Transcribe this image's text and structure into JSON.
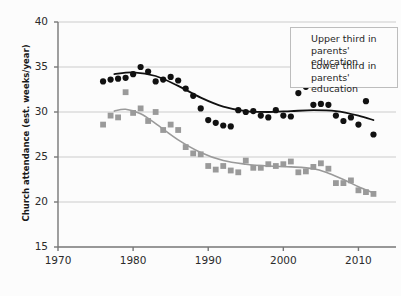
{
  "clipped_header": "...... .....",
  "chart_data": {
    "type": "scatter",
    "title": "",
    "xlabel": "",
    "ylabel": "Church attendance (est. weeks/year)",
    "xlim": [
      1970,
      2015
    ],
    "ylim": [
      15,
      40
    ],
    "xticks": [
      1970,
      1980,
      1990,
      2000,
      2010
    ],
    "yticks": [
      40,
      35,
      30,
      25,
      20,
      15
    ],
    "grid": "horizontal",
    "legend_position": "top-right",
    "colors": {
      "upper_third": "#111111",
      "lower_third": "#9a9a9a",
      "grid": "#cccccc",
      "axis": "#777777",
      "background": "#fcfcfc"
    },
    "series": [
      {
        "name": "Upper third in parents' education",
        "marker": "circle",
        "color": "#111111",
        "points": [
          [
            1976,
            33.4
          ],
          [
            1977,
            33.6
          ],
          [
            1978,
            33.7
          ],
          [
            1979,
            33.8
          ],
          [
            1980,
            34.2
          ],
          [
            1981,
            35.0
          ],
          [
            1982,
            34.5
          ],
          [
            1983,
            33.4
          ],
          [
            1984,
            33.6
          ],
          [
            1985,
            33.9
          ],
          [
            1986,
            33.5
          ],
          [
            1987,
            32.6
          ],
          [
            1988,
            31.8
          ],
          [
            1989,
            30.4
          ],
          [
            1990,
            29.1
          ],
          [
            1991,
            28.8
          ],
          [
            1992,
            28.5
          ],
          [
            1993,
            28.4
          ],
          [
            1994,
            30.2
          ],
          [
            1995,
            30.0
          ],
          [
            1996,
            30.1
          ],
          [
            1997,
            29.6
          ],
          [
            1998,
            29.4
          ],
          [
            1999,
            30.2
          ],
          [
            2000,
            29.6
          ],
          [
            2001,
            29.5
          ],
          [
            2002,
            32.1
          ],
          [
            2003,
            32.8
          ],
          [
            2004,
            30.8
          ],
          [
            2005,
            30.9
          ],
          [
            2006,
            30.8
          ],
          [
            2007,
            29.6
          ],
          [
            2008,
            29.0
          ],
          [
            2009,
            29.4
          ],
          [
            2010,
            28.6
          ],
          [
            2011,
            31.2
          ],
          [
            2012,
            27.5
          ]
        ],
        "trend": [
          [
            1977.5,
            34.2
          ],
          [
            1980,
            34.4
          ],
          [
            1983,
            34.0
          ],
          [
            1986,
            32.9
          ],
          [
            1989,
            31.6
          ],
          [
            1992,
            30.6
          ],
          [
            1995,
            30.1
          ],
          [
            1998,
            30.0
          ],
          [
            2001,
            30.1
          ],
          [
            2004,
            30.2
          ],
          [
            2007,
            30.1
          ],
          [
            2010,
            29.6
          ],
          [
            2012,
            29.1
          ]
        ]
      },
      {
        "name": "Lower third in parents' education",
        "marker": "square",
        "color": "#9a9a9a",
        "points": [
          [
            1976,
            28.6
          ],
          [
            1977,
            29.6
          ],
          [
            1978,
            29.4
          ],
          [
            1979,
            32.2
          ],
          [
            1980,
            29.9
          ],
          [
            1981,
            30.4
          ],
          [
            1982,
            29.0
          ],
          [
            1983,
            30.0
          ],
          [
            1984,
            28.0
          ],
          [
            1985,
            28.6
          ],
          [
            1986,
            28.0
          ],
          [
            1987,
            26.1
          ],
          [
            1988,
            25.4
          ],
          [
            1989,
            25.3
          ],
          [
            1990,
            24.0
          ],
          [
            1991,
            23.6
          ],
          [
            1992,
            24.0
          ],
          [
            1993,
            23.5
          ],
          [
            1994,
            23.3
          ],
          [
            1995,
            24.6
          ],
          [
            1996,
            23.8
          ],
          [
            1997,
            23.8
          ],
          [
            1998,
            24.2
          ],
          [
            1999,
            24.0
          ],
          [
            2000,
            24.2
          ],
          [
            2001,
            24.5
          ],
          [
            2002,
            23.3
          ],
          [
            2003,
            23.4
          ],
          [
            2004,
            23.9
          ],
          [
            2005,
            24.3
          ],
          [
            2006,
            23.7
          ],
          [
            2007,
            22.1
          ],
          [
            2008,
            22.1
          ],
          [
            2009,
            22.4
          ],
          [
            2010,
            21.3
          ],
          [
            2011,
            21.1
          ],
          [
            2012,
            20.9
          ]
        ],
        "trend": [
          [
            1977.5,
            30.1
          ],
          [
            1979,
            30.3
          ],
          [
            1981,
            29.8
          ],
          [
            1983,
            28.7
          ],
          [
            1986,
            26.9
          ],
          [
            1989,
            25.5
          ],
          [
            1992,
            24.6
          ],
          [
            1995,
            24.2
          ],
          [
            1998,
            24.0
          ],
          [
            2001,
            23.9
          ],
          [
            2004,
            23.7
          ],
          [
            2006,
            23.2
          ],
          [
            2008,
            22.5
          ],
          [
            2010,
            21.7
          ],
          [
            2012,
            21.0
          ]
        ]
      }
    ]
  },
  "legend": {
    "entries": [
      {
        "label": "Upper third in\nparents' education",
        "marker": "circle"
      },
      {
        "label": "Lower third in\nparents' education",
        "marker": "square"
      }
    ]
  }
}
